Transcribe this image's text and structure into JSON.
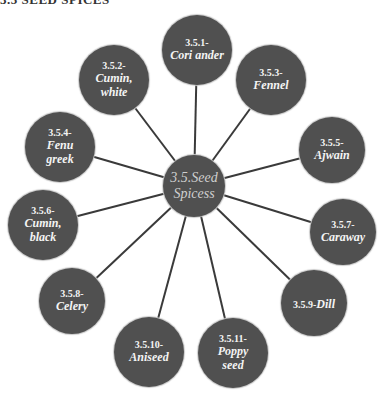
{
  "header": {
    "text": "3.5 SEED SPICES"
  },
  "colors": {
    "node_fill": "#505050",
    "link": "#3a3a3a",
    "text": "#f4f4f4",
    "center_text": "#cfcfcf",
    "background": "#ffffff"
  },
  "center": {
    "label_line1": "3.5.Seed",
    "label_line2": "Spicess",
    "x": 194,
    "y": 186,
    "r": 31
  },
  "nodes": [
    {
      "code": "3.5.1-",
      "name": "Cori ander",
      "name2": "",
      "x": 197,
      "y": 50,
      "r": 35
    },
    {
      "code": "3.5.2-",
      "name": "Cumin,",
      "name2": "white",
      "x": 114,
      "y": 80,
      "r": 35
    },
    {
      "code": "3.5.3-",
      "name": "Fennel",
      "name2": "",
      "x": 271,
      "y": 80,
      "r": 35
    },
    {
      "code": "3.5.4-",
      "name": "Fenu",
      "name2": "greek",
      "x": 60,
      "y": 147,
      "r": 35
    },
    {
      "code": "3.5.5-",
      "name": "Ajwain",
      "name2": "",
      "x": 332,
      "y": 150,
      "r": 33
    },
    {
      "code": "3.5.6-",
      "name": "Cumin,",
      "name2": "black",
      "x": 43,
      "y": 225,
      "r": 35
    },
    {
      "code": "3.5.7-",
      "name": "Caraway",
      "name2": "",
      "x": 343,
      "y": 232,
      "r": 33
    },
    {
      "code": "3.5.8-",
      "name": "Celery",
      "name2": "",
      "x": 72,
      "y": 301,
      "r": 33
    },
    {
      "code": "3.5.9-",
      "name": "Dill",
      "name2": "",
      "x": 314,
      "y": 303,
      "r": 33,
      "inline": true
    },
    {
      "code": "3.5.10-",
      "name": "Aniseed",
      "name2": "",
      "x": 149,
      "y": 352,
      "r": 35
    },
    {
      "code": "3.5.11-",
      "name": "Poppy",
      "name2": "seed",
      "x": 233,
      "y": 353,
      "r": 35
    }
  ]
}
